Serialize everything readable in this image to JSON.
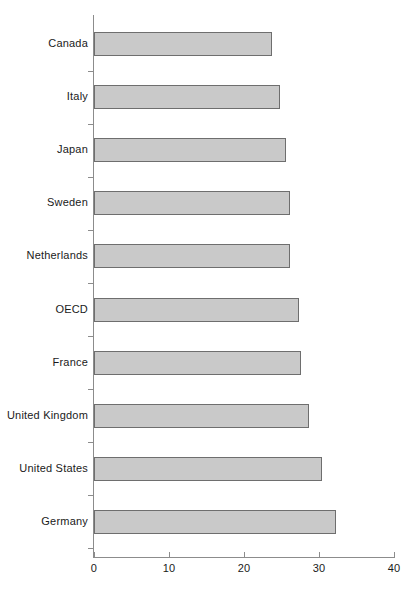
{
  "chart_data": {
    "type": "bar",
    "orientation": "horizontal",
    "title": "",
    "subtitle": "",
    "xlabel": "",
    "ylabel": "",
    "xlim": [
      0,
      40
    ],
    "ylim": null,
    "grid": false,
    "legend": null,
    "legend_position": "none",
    "x_ticks": [
      0,
      10,
      20,
      30,
      40
    ],
    "x_tick_labels": [
      "0",
      "10",
      "20",
      "30",
      "40"
    ],
    "categories": [
      "Canada",
      "Italy",
      "Japan",
      "Sweden",
      "Netherlands",
      "OECD",
      "France",
      "United Kingdom",
      "United States",
      "Germany"
    ],
    "values": [
      23.7,
      24.8,
      25.6,
      26.1,
      26.1,
      27.3,
      27.6,
      28.6,
      30.4,
      32.3
    ],
    "bar_color": "#c9c9c9",
    "bar_edge_color": "#6e6e6e",
    "axis_color": "#8c8c8c",
    "text_color": "#1a1a1a",
    "background_color": "#ffffff"
  }
}
